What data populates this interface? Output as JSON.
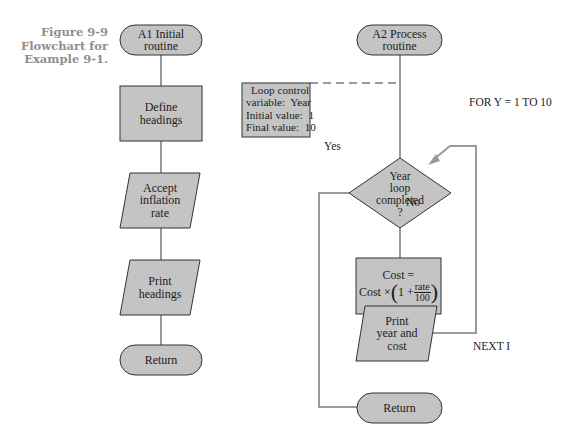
{
  "caption": {
    "line1": "Figure 9-9",
    "line2": "Flowchart for",
    "line3": "Example 9-1."
  },
  "colors": {
    "shape_fill": "#c4c4c4",
    "shape_stroke": "#333333",
    "connector": "#9a9a9a",
    "caption_text": "#8f8f8f"
  },
  "left_chart": {
    "start": {
      "line1": "A1 Initial",
      "line2": "routine"
    },
    "define": {
      "line1": "Define",
      "line2": "headings"
    },
    "accept": {
      "line1": "Accept",
      "line2": "inflation",
      "line3": "rate"
    },
    "print": {
      "line1": "Print",
      "line2": "headings"
    },
    "return": {
      "label": "Return"
    }
  },
  "right_chart": {
    "start": {
      "line1": "A2 Process",
      "line2": "routine"
    },
    "loop_note": {
      "line1": "Loop control",
      "line2": "variable:  Year",
      "line3": "Initial value:  1",
      "line4": "Final value:  10"
    },
    "decision": {
      "line1": "Year",
      "line2": "loop",
      "line3": "completed",
      "line4": "?"
    },
    "yes_label": "Yes",
    "no_label": "No",
    "for_label": "FOR Y = 1 TO 10",
    "next_label": "NEXT I",
    "compute": {
      "line1": "Cost =",
      "prefix": "Cost ×",
      "one_plus": "1 +",
      "numerator": "rate",
      "denominator": "100",
      "open_paren": "(",
      "close_paren": ")"
    },
    "print": {
      "line1": "Print",
      "line2": "year and",
      "line3": "cost"
    },
    "return": {
      "label": "Return"
    }
  }
}
